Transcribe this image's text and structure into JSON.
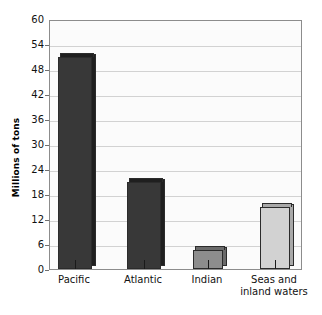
{
  "chart_data": {
    "type": "bar",
    "title": "",
    "subtitle": "",
    "xlabel": "",
    "ylabel": "Millions of tons",
    "categories": [
      "Pacific",
      "Atlantic",
      "Indian",
      "Seas and\ninland waters"
    ],
    "values": [
      51,
      21,
      4.5,
      15
    ],
    "ylim": [
      0,
      60
    ],
    "ytick_values": [
      0,
      6,
      12,
      18,
      24,
      30,
      36,
      42,
      48,
      54,
      60
    ],
    "ytick_labels": [
      "0",
      "6",
      "12",
      "18",
      "24",
      "30",
      "36",
      "42",
      "48",
      "54",
      "60"
    ],
    "grid": true,
    "legend": false,
    "bar_colors": [
      "#383838",
      "#383838",
      "#8d8d8d",
      "#d2d2d2"
    ],
    "bar_side_colors": [
      "#1f1f1f",
      "#1f1f1f",
      "#6a6a6a",
      "#a8a8a8"
    ],
    "plot_background": "#fbfbfb",
    "axis_color": "#8c8c8c",
    "gridline_color": "#d2d2d2",
    "text_color": "#111111"
  },
  "axis": {
    "ylabel_text": "Millions of tons"
  },
  "ticks": [
    {
      "label": "60",
      "value": 60
    },
    {
      "label": "54",
      "value": 54
    },
    {
      "label": "48",
      "value": 48
    },
    {
      "label": "42",
      "value": 42
    },
    {
      "label": "36",
      "value": 36
    },
    {
      "label": "30",
      "value": 30
    },
    {
      "label": "24",
      "value": 24
    },
    {
      "label": "18",
      "value": 18
    },
    {
      "label": "12",
      "value": 12
    },
    {
      "label": "6",
      "value": 6
    },
    {
      "label": "0",
      "value": 0
    }
  ],
  "bars": [
    {
      "label": "Pacific",
      "value": 51,
      "color": "#383838",
      "side": "#1f1f1f"
    },
    {
      "label": "Atlantic",
      "value": 21,
      "color": "#383838",
      "side": "#1f1f1f"
    },
    {
      "label": "Indian",
      "value": 4.5,
      "color": "#8d8d8d",
      "side": "#6a6a6a"
    },
    {
      "label": "Seas and\ninland waters",
      "value": 15,
      "color": "#d2d2d2",
      "side": "#a8a8a8"
    }
  ]
}
